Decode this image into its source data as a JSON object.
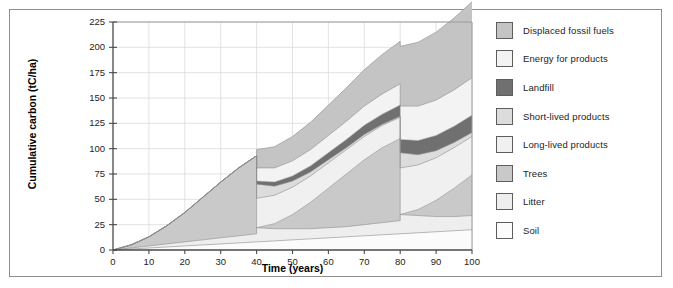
{
  "figure": {
    "background_color": "#ffffff",
    "frame_color": "#8e8e8e"
  },
  "chart_data": {
    "type": "area",
    "stacked": true,
    "title": "",
    "subtitle": "",
    "xlabel": "Time (years)",
    "ylabel": "Cumulative carbon (tC/ha)",
    "xlim": [
      0,
      100
    ],
    "ylim": [
      0,
      225
    ],
    "xticks": [
      0,
      10,
      20,
      30,
      40,
      50,
      60,
      70,
      80,
      90,
      100
    ],
    "yticks": [
      0,
      25,
      50,
      75,
      100,
      125,
      150,
      175,
      200,
      225
    ],
    "xtick_labels": [
      "0",
      "10",
      "20",
      "30",
      "40",
      "50",
      "60",
      "70",
      "80",
      "90",
      "100"
    ],
    "ytick_labels": [
      "0",
      "25",
      "50",
      "75",
      "100",
      "125",
      "150",
      "175",
      "200",
      "225"
    ],
    "grid": true,
    "grid_axis": "both",
    "grid_color": "#d7d7d7",
    "legend_position": "right",
    "annotations": [
      "Harvest events at year 40 and year 80"
    ],
    "x": [
      0,
      5,
      10,
      15,
      20,
      25,
      30,
      35,
      40,
      40,
      45,
      50,
      55,
      60,
      65,
      70,
      75,
      80,
      80,
      85,
      90,
      95,
      100
    ],
    "series": [
      {
        "name": "Soil",
        "color": "#fbfbfb",
        "values": [
          0,
          1,
          2,
          3,
          4,
          5,
          6,
          7,
          8,
          8,
          9,
          10,
          11,
          12,
          13,
          14,
          15,
          16,
          16,
          17,
          18,
          19,
          20
        ]
      },
      {
        "name": "Litter",
        "color": "#eeeeee",
        "values": [
          0,
          1,
          2,
          3,
          4,
          5,
          6,
          7,
          8,
          14,
          12,
          11,
          10,
          10,
          10,
          11,
          12,
          13,
          19,
          17,
          15,
          14,
          14
        ]
      },
      {
        "name": "Trees",
        "color": "#c9c9c9",
        "values": [
          0,
          3,
          9,
          18,
          29,
          42,
          55,
          67,
          77,
          0,
          5,
          14,
          26,
          39,
          52,
          64,
          74,
          81,
          0,
          6,
          16,
          28,
          40
        ]
      },
      {
        "name": "Long-lived products",
        "color": "#f0f0f0",
        "values": [
          0,
          0,
          0,
          0,
          0,
          0,
          0,
          0,
          0,
          29,
          28,
          27,
          26,
          25,
          24,
          23,
          22,
          21,
          46,
          44,
          42,
          40,
          38
        ]
      },
      {
        "name": "Short-lived products",
        "color": "#dcdcdc",
        "values": [
          0,
          0,
          0,
          0,
          0,
          0,
          0,
          0,
          0,
          14,
          9,
          6,
          4,
          3,
          2,
          2,
          1,
          1,
          15,
          10,
          7,
          5,
          4
        ]
      },
      {
        "name": "Landfill",
        "color": "#707070",
        "values": [
          0,
          0,
          0,
          0,
          0,
          0,
          0,
          0,
          0,
          3,
          4,
          5,
          6,
          7,
          8,
          9,
          10,
          11,
          13,
          14,
          15,
          16,
          17
        ]
      },
      {
        "name": "Energy for products",
        "color": "#f3f3f3",
        "values": [
          0,
          0,
          0,
          0,
          0,
          0,
          0,
          0,
          0,
          13,
          14,
          15,
          16,
          17,
          18,
          19,
          20,
          21,
          33,
          34,
          35,
          36,
          37
        ]
      },
      {
        "name": "Displaced fossil fuels",
        "color": "#c4c4c4",
        "values": [
          0,
          0,
          0,
          0,
          0,
          0,
          0,
          0,
          0,
          18,
          21,
          24,
          27,
          30,
          33,
          36,
          39,
          42,
          59,
          63,
          67,
          71,
          75
        ]
      }
    ],
    "totals": [
      0,
      5,
      13,
      24,
      37,
      52,
      67,
      81,
      93,
      99,
      102,
      112,
      126,
      143,
      160,
      178,
      193,
      206,
      201,
      205,
      215,
      229,
      245
    ]
  },
  "legend": {
    "items": [
      {
        "label": "Displaced fossil fuels",
        "color": "#c4c4c4"
      },
      {
        "label": "Energy for products",
        "color": "#f3f3f3"
      },
      {
        "label": "Landfill",
        "color": "#707070"
      },
      {
        "label": "Short-lived products",
        "color": "#dcdcdc"
      },
      {
        "label": "Long-lived products",
        "color": "#f0f0f0"
      },
      {
        "label": "Trees",
        "color": "#c9c9c9"
      },
      {
        "label": "Litter",
        "color": "#eeeeee"
      },
      {
        "label": "Soil",
        "color": "#fbfbfb"
      }
    ]
  }
}
